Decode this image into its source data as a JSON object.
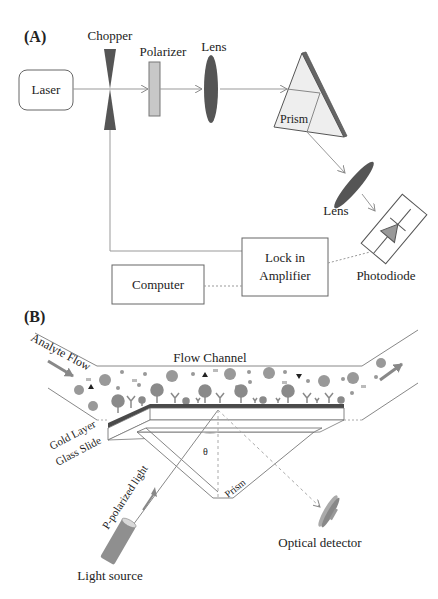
{
  "figure": {
    "panel_a": {
      "label": "(A)",
      "components": {
        "laser": "Laser",
        "chopper": "Chopper",
        "polarizer": "Polarizer",
        "lens1": "Lens",
        "prism": "Prism",
        "lens2": "Lens",
        "photodiode": "Photodiode",
        "lockin_line1": "Lock in",
        "lockin_line2": "Amplifier",
        "computer": "Computer"
      }
    },
    "panel_b": {
      "label": "(B)",
      "labels": {
        "analyte_flow": "Analyte Flow",
        "flow_channel": "Flow Channel",
        "gold_layer": "Gold Layer",
        "glass_slide": "Glass Slide",
        "p_polarized": "P-polarized light",
        "theta": "θ",
        "prism": "Prism",
        "light_source": "Light source",
        "optical_detector": "Optical detector"
      }
    },
    "colors": {
      "line": "#888888",
      "dark_fill": "#555555",
      "mid_fill": "#8a8a8a",
      "light_fill": "#cfcfcf",
      "prism_fill": "#eeeeee",
      "gold": "#4a4a4a"
    }
  }
}
